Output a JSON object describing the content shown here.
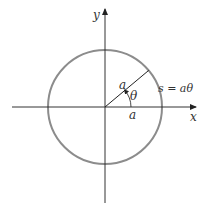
{
  "diagram": {
    "axes": {
      "x_label": "x",
      "y_label": "y"
    },
    "circle": {
      "center": [
        105,
        107
      ],
      "radius": 57,
      "stroke_color": "#8c8c8c"
    },
    "radius_line": {
      "label": "a",
      "angle_deg": 40
    },
    "angle": {
      "label": "θ"
    },
    "x_radius_label": "a",
    "arc_length_label": "s = aθ",
    "axis_color": "#333333"
  }
}
